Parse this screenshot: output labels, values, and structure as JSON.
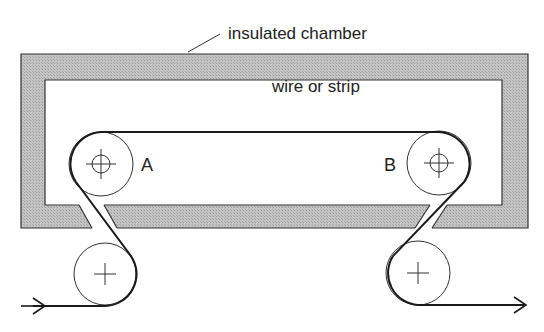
{
  "title_label": "insulated chamber",
  "wire_label": "wire or strip",
  "roller_labels": {
    "a": "A",
    "b": "B"
  },
  "colors": {
    "insulation_fill": "#bdbdbd",
    "line": "#1a1a1a",
    "background": "#ffffff"
  },
  "components": [
    {
      "name": "insulated chamber",
      "type": "hatched wall"
    },
    {
      "name": "roller A",
      "type": "guide roller with center mark",
      "inside_chamber": true
    },
    {
      "name": "roller B",
      "type": "guide roller with center mark",
      "inside_chamber": true
    },
    {
      "name": "entry roller",
      "type": "external roller",
      "inside_chamber": false
    },
    {
      "name": "exit roller",
      "type": "external roller",
      "inside_chamber": false
    },
    {
      "name": "wire or strip",
      "type": "continuous path"
    },
    {
      "name": "input arrow",
      "direction": "right"
    },
    {
      "name": "output arrow",
      "direction": "right"
    }
  ]
}
